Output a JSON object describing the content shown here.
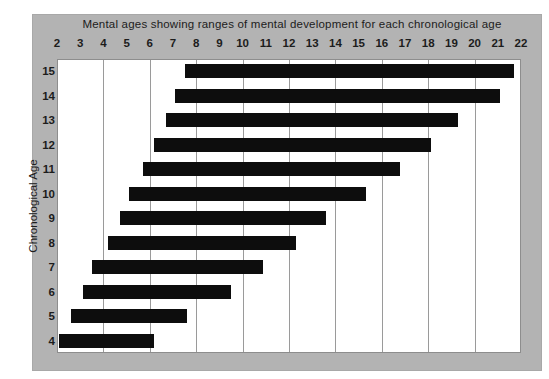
{
  "chart_data": {
    "type": "bar",
    "orientation": "horizontal",
    "title": "Mental ages showing ranges of mental development for each chronological age",
    "xlabel": "",
    "ylabel": "Chronological Age",
    "xlim": [
      2,
      22
    ],
    "ylim_categories": [
      "15",
      "14",
      "13",
      "12",
      "11",
      "10",
      "9",
      "8",
      "7",
      "6",
      "5",
      "4"
    ],
    "x_tick_labels": [
      "2",
      "3",
      "4",
      "5",
      "6",
      "7",
      "8",
      "9",
      "10",
      "11",
      "12",
      "13",
      "14",
      "15",
      "16",
      "17",
      "18",
      "19",
      "20",
      "21",
      "22"
    ],
    "x_tick_values": [
      2,
      3,
      4,
      5,
      6,
      7,
      8,
      9,
      10,
      11,
      12,
      13,
      14,
      15,
      16,
      17,
      18,
      19,
      20,
      21,
      22
    ],
    "y_tick_labels": [
      "15",
      "14",
      "13",
      "12",
      "11",
      "10",
      "9",
      "8",
      "7",
      "6",
      "5",
      "4"
    ],
    "gridlines": {
      "vertical_at": [
        4,
        6,
        8,
        10,
        12,
        14,
        16,
        18,
        20,
        22
      ],
      "horizontal": false,
      "color": "#9a9a9a"
    },
    "legend": null,
    "bar_color": "#0d0d0d",
    "background_color": "#b3b3b3",
    "plot_background_color": "#ffffff",
    "series": [
      {
        "name": "range",
        "kind": "floating-bar",
        "unit": "mental age (years)"
      }
    ],
    "ranges": [
      {
        "chronological_age": "15",
        "start": 7.5,
        "end": 21.7
      },
      {
        "chronological_age": "14",
        "start": 7.1,
        "end": 21.1
      },
      {
        "chronological_age": "13",
        "start": 6.7,
        "end": 19.3
      },
      {
        "chronological_age": "12",
        "start": 6.2,
        "end": 18.1
      },
      {
        "chronological_age": "11",
        "start": 5.7,
        "end": 16.8
      },
      {
        "chronological_age": "10",
        "start": 5.1,
        "end": 15.3
      },
      {
        "chronological_age": "9",
        "start": 4.7,
        "end": 13.6
      },
      {
        "chronological_age": "8",
        "start": 4.2,
        "end": 12.3
      },
      {
        "chronological_age": "7",
        "start": 3.5,
        "end": 10.9
      },
      {
        "chronological_age": "6",
        "start": 3.1,
        "end": 9.5
      },
      {
        "chronological_age": "5",
        "start": 2.6,
        "end": 7.6
      },
      {
        "chronological_age": "4",
        "start": 2.1,
        "end": 6.2
      }
    ]
  }
}
